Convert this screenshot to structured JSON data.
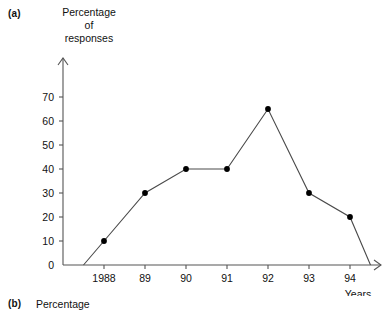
{
  "panels": {
    "a_tag": "(a)",
    "b_tag": "(b)",
    "b_title": "Percentage"
  },
  "axis_title_lines": {
    "line1": "Percentage",
    "line2": "of",
    "line3": "responses"
  },
  "chart_data": {
    "type": "line",
    "title": "",
    "xlabel": "Years",
    "ylabel": "Percentage of responses",
    "categories": [
      "1988",
      "89",
      "90",
      "91",
      "92",
      "93",
      "94"
    ],
    "values": [
      10,
      30,
      40,
      40,
      65,
      30,
      20
    ],
    "yticks": [
      0,
      10,
      20,
      30,
      40,
      50,
      60,
      70
    ],
    "ytick_labels": [
      "0",
      "10",
      "20",
      "30",
      "40",
      "50",
      "60",
      "70"
    ],
    "ylim": [
      0,
      75
    ],
    "grid": false,
    "legend": null,
    "marker": "filled-circle",
    "line_color": "#4a4a4a",
    "marker_color": "#000000",
    "axis_color": "#555555",
    "baseline_start_value": 0,
    "baseline_end_value": 0
  }
}
